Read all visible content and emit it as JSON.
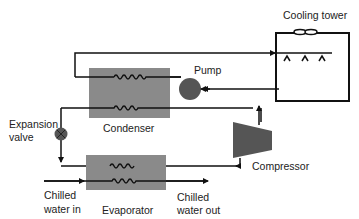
{
  "diagram": {
    "type": "chiller refrigeration cycle",
    "labels": {
      "cooling_tower": "Cooling tower",
      "pump": "Pump",
      "condenser": "Condenser",
      "expansion_valve_line1": "Expansion",
      "expansion_valve_line2": "valve",
      "compressor": "Compressor",
      "evaporator": "Evaporator",
      "chilled_in_line1": "Chilled",
      "chilled_in_line2": "water in",
      "chilled_out_line1": "Chilled",
      "chilled_out_line2": "water out"
    },
    "colors": {
      "component_fill": "#8a8a8a",
      "pump_fill": "#555555",
      "compressor_fill": "#555555",
      "pipe": "#111111",
      "background": "#ffffff"
    },
    "components": [
      "Cooling tower",
      "Pump",
      "Condenser",
      "Expansion valve",
      "Compressor",
      "Evaporator"
    ],
    "flows": [
      {
        "from": "Condenser",
        "to": "Cooling tower",
        "medium": "condenser water"
      },
      {
        "from": "Cooling tower",
        "to": "Pump",
        "medium": "condenser water"
      },
      {
        "from": "Pump",
        "to": "Condenser",
        "medium": "condenser water"
      },
      {
        "from": "Condenser",
        "to": "Expansion valve",
        "medium": "refrigerant"
      },
      {
        "from": "Expansion valve",
        "to": "Evaporator",
        "medium": "refrigerant"
      },
      {
        "from": "Evaporator",
        "to": "Compressor",
        "medium": "refrigerant"
      },
      {
        "from": "Compressor",
        "to": "Condenser",
        "medium": "refrigerant"
      },
      {
        "from": "Chilled water in",
        "to": "Evaporator",
        "medium": "chilled water"
      },
      {
        "from": "Evaporator",
        "to": "Chilled water out",
        "medium": "chilled water"
      }
    ]
  }
}
